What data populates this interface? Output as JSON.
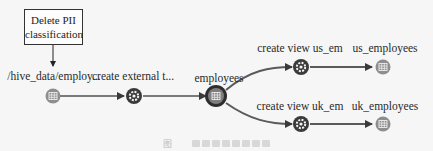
{
  "classification": {
    "line1": "Delete PII",
    "line2": "classification"
  },
  "nodes": [
    {
      "id": "source",
      "label": "/hive_data/employ...",
      "type": "dataset",
      "icon": "table-icon"
    },
    {
      "id": "process1",
      "label": "create external t...",
      "type": "process",
      "icon": "gear-icon"
    },
    {
      "id": "employees",
      "label": "employees",
      "type": "dataset-selected",
      "icon": "table-icon"
    },
    {
      "id": "process_us",
      "label": "create view us_em",
      "type": "process",
      "icon": "gear-icon"
    },
    {
      "id": "us_employees",
      "label": "us_employees",
      "type": "dataset",
      "icon": "table-icon"
    },
    {
      "id": "process_uk",
      "label": "create view uk_em",
      "type": "process",
      "icon": "gear-icon"
    },
    {
      "id": "uk_employees",
      "label": "uk_employees",
      "type": "dataset",
      "icon": "table-icon"
    }
  ],
  "caption": {
    "prefix": "图"
  },
  "colors": {
    "edge": "#6e6e6e",
    "dataset_fill": "#8a8a8a",
    "process_fill": "#3a3a3a",
    "selected_ring": "#2e2e2e"
  }
}
